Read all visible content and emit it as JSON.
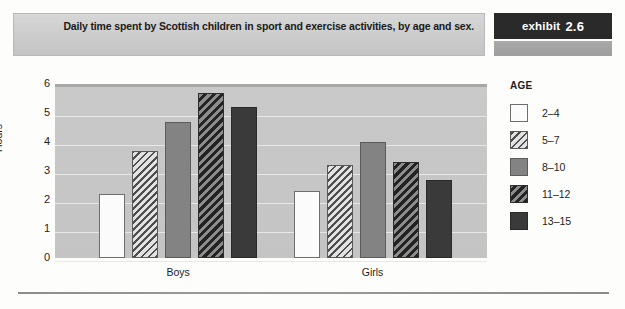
{
  "header": {
    "title": "Daily time spent by Scottish children in sport and exercise activities, by age and sex.",
    "exhibit_word": "exhibit",
    "exhibit_number": "2.6"
  },
  "legend": {
    "title": "AGE",
    "items": [
      {
        "label": "2–4",
        "swatch": "white-solid-swatch"
      },
      {
        "label": "5–7",
        "swatch": "light-hatch-swatch"
      },
      {
        "label": "8–10",
        "swatch": "gray-solid-swatch"
      },
      {
        "label": "11–12",
        "swatch": "dark-hatch-swatch"
      },
      {
        "label": "13–15",
        "swatch": "dark-solid-swatch"
      }
    ]
  },
  "chart_data": {
    "type": "bar",
    "title": "Daily time spent by Scottish children in sport and exercise activities, by age and sex.",
    "xlabel": "",
    "ylabel": "Hours",
    "ylim": [
      0,
      6
    ],
    "yticks": [
      0,
      1,
      2,
      3,
      4,
      5,
      6
    ],
    "ytick_labels": [
      "0",
      "1",
      "2",
      "3",
      "4",
      "5",
      "6"
    ],
    "grid": true,
    "legend_position": "right",
    "legend_title": "AGE",
    "categories": [
      "Boys",
      "Girls"
    ],
    "series": [
      {
        "name": "2–4",
        "values": [
          2.2,
          2.3
        ]
      },
      {
        "name": "5–7",
        "values": [
          3.7,
          3.2
        ]
      },
      {
        "name": "8–10",
        "values": [
          4.7,
          4.0
        ]
      },
      {
        "name": "11–12",
        "values": [
          5.7,
          3.3
        ]
      },
      {
        "name": "13–15",
        "values": [
          5.2,
          2.7
        ]
      }
    ]
  }
}
